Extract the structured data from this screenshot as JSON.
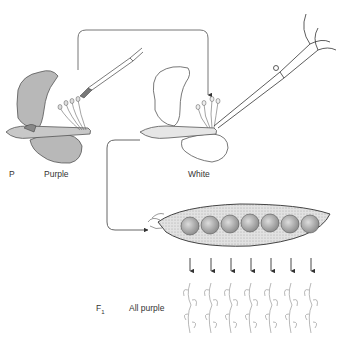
{
  "diagram": {
    "parents": {
      "generation_label": "P",
      "left_flower": {
        "label": "Purple",
        "color": "#b8b8b8",
        "action": "pollen transferred with brush"
      },
      "right_flower": {
        "label": "White",
        "color": "#ffffff",
        "action": "stamens removed with scissors"
      }
    },
    "pod": {
      "seed_count": 7
    },
    "offspring": {
      "generation_label": "F",
      "generation_subscript": "1",
      "result_label": "All purple",
      "plant_count": 7,
      "arrow_count": 7
    },
    "colors": {
      "line": "#555555",
      "purple_petal": "#b8b8b8",
      "pod_fill": "#d8d8d8",
      "seed_fill": "#bdbdbd"
    }
  }
}
